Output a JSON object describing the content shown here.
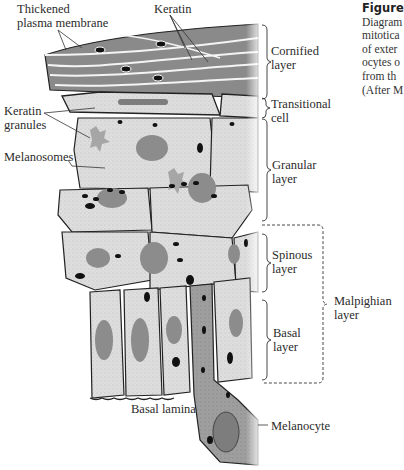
{
  "figure": {
    "caption": {
      "heading": "Figure",
      "lines": [
        "Diagram",
        "mitotica",
        "of exter",
        "ocytes o",
        "from th",
        "(After M"
      ]
    },
    "labels": {
      "thickened_membrane": "Thickened\nplasma membrane",
      "keratin": "Keratin",
      "keratin_granules": "Keratin\ngranules",
      "melanosomes": "Melanosomes",
      "basal_lamina": "Basal lamina",
      "melanocyte": "Melanocyte"
    },
    "layers": [
      {
        "id": "cornified",
        "label": "Cornified\nlayer"
      },
      {
        "id": "transitional",
        "label": "Transitional\ncell"
      },
      {
        "id": "granular",
        "label": "Granular\nlayer"
      },
      {
        "id": "spinous",
        "label": "Spinous\nlayer"
      },
      {
        "id": "basal",
        "label": "Basal\nlayer"
      },
      {
        "id": "malpighian",
        "label": "Malpighian\nlayer"
      }
    ],
    "colors": {
      "cornified_fill": "#8a8a8a",
      "cell_fill": "#dcdcdc",
      "nucleus_fill": "#8c8c8c",
      "melanosome": "#111111",
      "melanocyte_fill": "#a8a8a8",
      "keratin_granule": "#a6a6a6"
    }
  }
}
